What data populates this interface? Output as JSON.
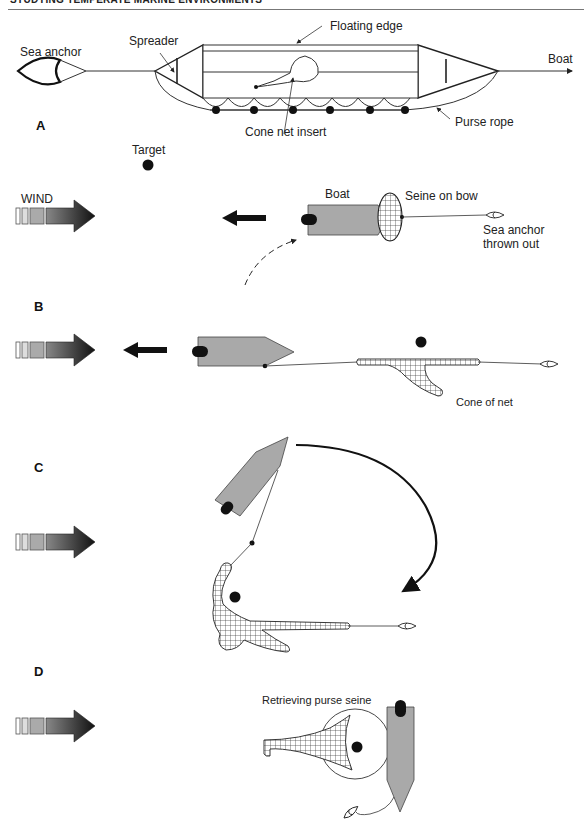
{
  "header": {
    "running_title": "STUDYING TEMPERATE MARINE ENVIRONMENTS"
  },
  "top_diagram": {
    "labels": {
      "sea_anchor": "Sea anchor",
      "spreader": "Spreader",
      "floating_edge": "Floating edge",
      "boat": "Boat",
      "purse_rope": "Purse rope",
      "cone_net_insert": "Cone net insert"
    }
  },
  "panels": [
    {
      "letter": "A",
      "labels": {
        "target": "Target",
        "wind": "WIND",
        "boat": "Boat",
        "seine_on_bow": "Seine on bow",
        "sea_anchor_line1": "Sea anchor",
        "sea_anchor_line2": "thrown out"
      }
    },
    {
      "letter": "B",
      "labels": {
        "cone_of_net": "Cone of net"
      }
    },
    {
      "letter": "C",
      "labels": {}
    },
    {
      "letter": "D",
      "labels": {
        "retrieving": "Retrieving purse seine"
      }
    }
  ],
  "colors": {
    "boat_fill": "#a9a9a9",
    "ink": "#111111",
    "line": "#333333",
    "net_fill": "#ffffff"
  }
}
